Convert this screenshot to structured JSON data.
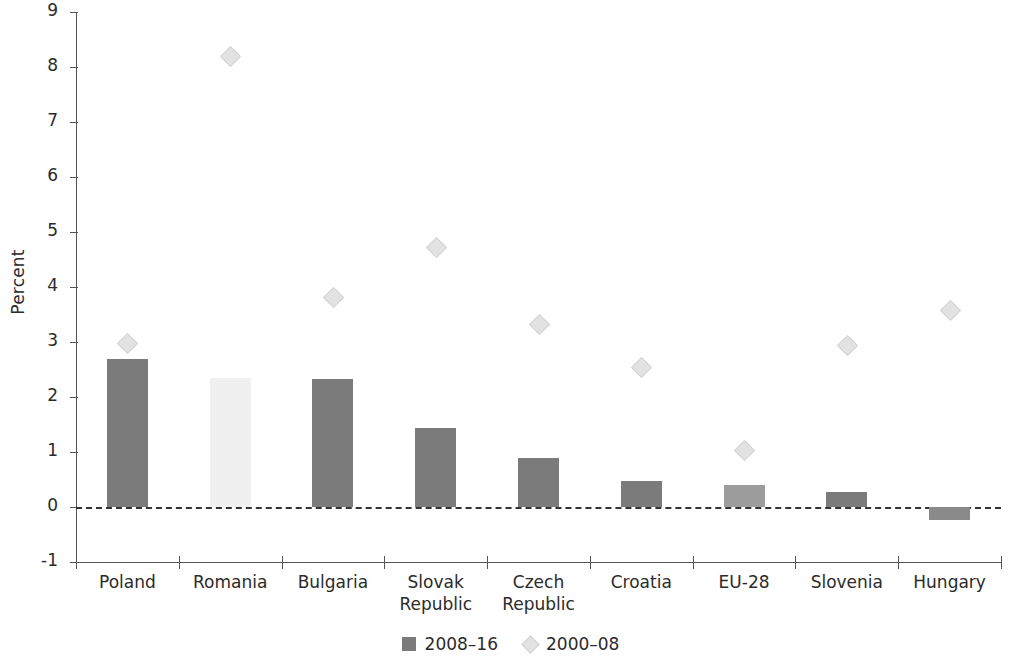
{
  "chart_data": {
    "type": "bar",
    "title": "",
    "subtitle": "",
    "xlabel": "",
    "ylabel": "Percent",
    "ylim": [
      -1,
      9
    ],
    "ytick_step": 1,
    "grid": false,
    "legend_position": "bottom-center",
    "zero_reference_line": true,
    "categories": [
      "Poland",
      "Romania",
      "Bulgaria",
      "Slovak\nRepublic",
      "Czech\nRepublic",
      "Croatia",
      "EU-28",
      "Slovenia",
      "Hungary"
    ],
    "ytick_labels": [
      "9",
      "8",
      "7",
      "6",
      "5",
      "4",
      "3",
      "2",
      "1",
      "0",
      "-1"
    ],
    "series": [
      {
        "name": "2008–16",
        "mark": "bar",
        "color": "#7b7b7b",
        "values": [
          2.7,
          2.35,
          2.33,
          1.44,
          0.9,
          0.48,
          0.4,
          0.27,
          -0.24
        ]
      },
      {
        "name": "2000–08",
        "mark": "diamond",
        "color": "#e2e2e2",
        "values": [
          2.98,
          8.2,
          3.81,
          4.73,
          3.32,
          2.54,
          1.04,
          2.94,
          3.58
        ]
      }
    ]
  },
  "legend": {
    "items": [
      {
        "label": "2008–16",
        "marker": "bar-swatch-icon"
      },
      {
        "label": "2000–08",
        "marker": "diamond-swatch-icon"
      }
    ]
  },
  "axes": {
    "y_label": "Percent"
  }
}
